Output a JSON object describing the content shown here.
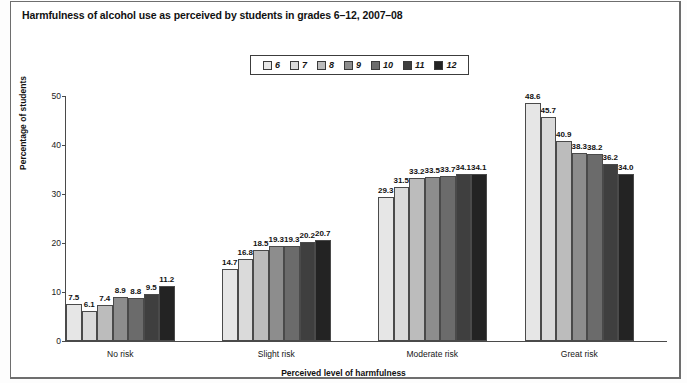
{
  "title": "Harmfulness of alcohol use as perceived by students in grades 6–12, 2007–08",
  "chart_data": {
    "type": "bar",
    "title": "Harmfulness of alcohol use as perceived by students in grades 6–12, 2007–08",
    "xlabel": "Perceived level of harmfulness",
    "ylabel": "Percentage of students",
    "categories": [
      "No risk",
      "Slight risk",
      "Moderate risk",
      "Great risk"
    ],
    "ylim": [
      0,
      50
    ],
    "yticks": [
      0,
      10,
      20,
      30,
      40,
      50
    ],
    "grid": false,
    "legend_position": "top-center",
    "legend_title": "",
    "series": [
      {
        "name": "6",
        "color": "#e6e6e6",
        "values": [
          7.5,
          14.7,
          29.3,
          48.6
        ]
      },
      {
        "name": "7",
        "color": "#dadada",
        "values": [
          6.1,
          16.8,
          31.5,
          45.7
        ]
      },
      {
        "name": "8",
        "color": "#bcbcbc",
        "values": [
          7.4,
          18.5,
          33.2,
          40.9
        ]
      },
      {
        "name": "9",
        "color": "#8d8d8d",
        "values": [
          8.9,
          19.3,
          33.5,
          38.3
        ]
      },
      {
        "name": "10",
        "color": "#6b6b6b",
        "values": [
          8.8,
          19.3,
          33.7,
          38.2
        ]
      },
      {
        "name": "11",
        "color": "#3f3f3f",
        "values": [
          9.5,
          20.2,
          34.1,
          36.2
        ]
      },
      {
        "name": "12",
        "color": "#232323",
        "values": [
          11.2,
          20.7,
          34.1,
          34.0
        ]
      }
    ],
    "value_labels": [
      [
        "7.5",
        "6.1",
        "7.4",
        "8.9",
        "8.8",
        "9.5",
        "11.2"
      ],
      [
        "14.7",
        "16.8",
        "18.5",
        "19.3",
        "19.3",
        "20.2",
        "20.7"
      ],
      [
        "29.3",
        "31.5",
        "33.2",
        "33.5",
        "33.7",
        "34.1",
        "34.1"
      ],
      [
        "48.6",
        "45.7",
        "40.9",
        "38.3",
        "38.2",
        "36.2",
        "34.0"
      ]
    ],
    "ytick_labels": [
      "0",
      "10",
      "20",
      "30",
      "40",
      "50"
    ]
  }
}
